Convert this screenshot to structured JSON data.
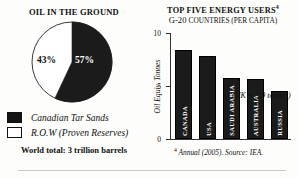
{
  "left": {
    "title": "OIL IN THE GROUND",
    "pie": {
      "slice_tar_label": "57%",
      "slice_row_label": "43%"
    },
    "legend": [
      {
        "swatch": "black",
        "label": "Canadian Tar Sands"
      },
      {
        "swatch": "white",
        "label": "R.O.W (Proven Reserves)"
      }
    ],
    "world_total": "World total: 3 trillion barrels"
  },
  "right": {
    "title": "TOP FIVE ENERGY USERS",
    "title_footnote_marker": "4",
    "subtitle_prefix": "G-20 ",
    "subtitle_smallcaps": "COUNTRIES (PER CAPITA)",
    "annotation": "(UK = 3.9 tonnes)",
    "footnote_marker": "4",
    "footnote": "Annual (2005). Source: IEA."
  },
  "chart_data": [
    {
      "type": "pie",
      "title": "OIL IN THE GROUND",
      "labels": [
        "Canadian Tar Sands",
        "R.O.W (Proven Reserves)"
      ],
      "values": [
        57,
        43
      ],
      "value_labels": [
        "57%",
        "43%"
      ],
      "colors": [
        "#1b1b1b",
        "#ffffff"
      ],
      "note": "World total: 3 trillion barrels",
      "legend_position": "bottom-left",
      "start_angle_deg": 0,
      "direction": "clockwise"
    },
    {
      "type": "bar",
      "title": "TOP FIVE ENERGY USERS",
      "subtitle": "G-20 COUNTRIES (PER CAPITA)",
      "categories": [
        "CANADA",
        "USA",
        "SAUDI ARABIA",
        "AUSTRALIA",
        "RUSSIA"
      ],
      "values": [
        8.4,
        7.8,
        5.8,
        5.7,
        4.5
      ],
      "xlabel": "",
      "ylabel": "Oil Equiv. Tonnes",
      "ylim": [
        0,
        10
      ],
      "yticks": [
        0,
        5,
        10
      ],
      "ytick_labels": [
        "0",
        "5",
        "10"
      ],
      "grid": false,
      "legend_position": "none",
      "bar_color": "#1b1b1b",
      "annotations": [
        "(UK = 3.9 tonnes)"
      ],
      "source": "Annual (2005). Source: IEA."
    }
  ]
}
